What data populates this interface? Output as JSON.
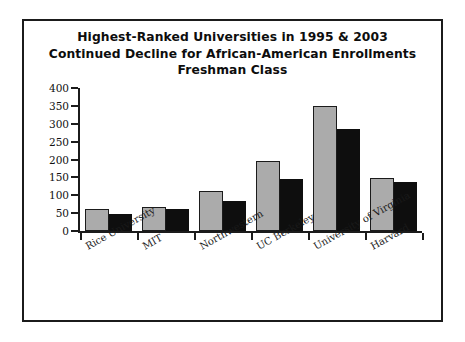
{
  "figure": {
    "title_lines": [
      "Highest-Ranked Universities in 1995 & 2003",
      "Continued Decline for African-American Enrollments",
      "Freshman Class"
    ],
    "colors": {
      "series_1995": "#ababab",
      "series_2003": "#0e0e0e",
      "axis": "#1b1b1b",
      "background": "#ffffff",
      "border": "#1b1b1b"
    }
  },
  "chart_data": {
    "type": "bar",
    "title": "Highest-Ranked Universities in 1995 & 2003 Continued Decline for African-American Enrollments Freshman Class",
    "xlabel": "",
    "ylabel": "",
    "ylim": [
      0,
      400
    ],
    "yticks": [
      0,
      50,
      100,
      150,
      200,
      250,
      300,
      350,
      400
    ],
    "ytick_labels": [
      "0",
      "50",
      "100",
      "150",
      "200",
      "250",
      "300",
      "350",
      "400"
    ],
    "grid": false,
    "legend": "none",
    "categories": [
      "Rice University",
      "MIT",
      "Northwestern",
      "UC Berkeley",
      "University of Virginia",
      "Harvard"
    ],
    "series": [
      {
        "name": "1995",
        "color": "#ababab",
        "values": [
          62,
          67,
          113,
          197,
          350,
          147
        ]
      },
      {
        "name": "2003",
        "color": "#0e0e0e",
        "values": [
          47,
          62,
          85,
          145,
          285,
          138
        ]
      }
    ]
  }
}
